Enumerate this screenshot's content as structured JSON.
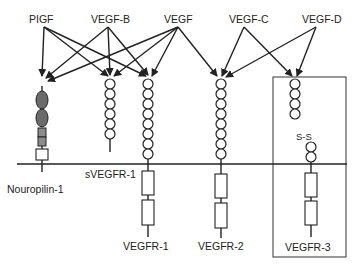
{
  "diagram": {
    "ligands": [
      {
        "id": "plgf",
        "label": "PIGF"
      },
      {
        "id": "vegfb",
        "label": "VEGF-B"
      },
      {
        "id": "vegf",
        "label": "VEGF"
      },
      {
        "id": "vegfc",
        "label": "VEGF-C"
      },
      {
        "id": "vegfd",
        "label": "VEGF-D"
      }
    ],
    "receptors": [
      {
        "id": "nrp1",
        "label": "Nouropilin-1"
      },
      {
        "id": "svegfr1",
        "label": "sVEGFR-1"
      },
      {
        "id": "vegfr1",
        "label": "VEGFR-1"
      },
      {
        "id": "vegfr2",
        "label": "VEGFR-2"
      },
      {
        "id": "vegfr3",
        "label": "VEGFR-3"
      }
    ],
    "annotations": {
      "disulfide": "S-S"
    },
    "bindings": [
      {
        "from": "PIGF",
        "to": [
          "Nouropilin-1",
          "sVEGFR-1",
          "VEGFR-1"
        ]
      },
      {
        "from": "VEGF-B",
        "to": [
          "Nouropilin-1",
          "sVEGFR-1",
          "VEGFR-1"
        ]
      },
      {
        "from": "VEGF",
        "to": [
          "Nouropilin-1",
          "sVEGFR-1",
          "VEGFR-1",
          "VEGFR-2"
        ]
      },
      {
        "from": "VEGF-C",
        "to": [
          "VEGFR-2",
          "VEGFR-3"
        ]
      },
      {
        "from": "VEGF-D",
        "to": [
          "VEGFR-2",
          "VEGFR-3"
        ]
      }
    ],
    "colors": {
      "stroke": "#222222",
      "dark_domain": "#6b6b6b",
      "gray_domain": "#8c8c8c"
    }
  }
}
